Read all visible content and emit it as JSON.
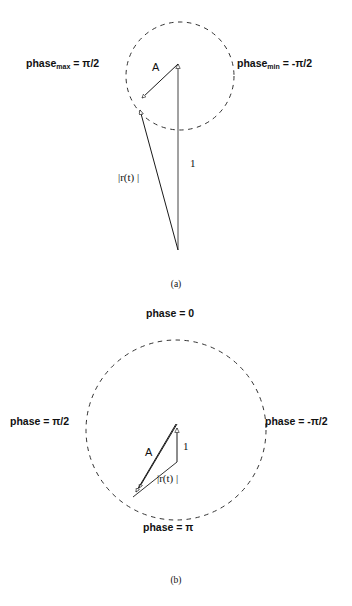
{
  "figure": {
    "background_color": "#ffffff",
    "line_color": "#1a1a1a",
    "panels": [
      {
        "id": "panel-a",
        "caption": "(a)",
        "circle": {
          "cx": 180,
          "cy": 76,
          "r": 54,
          "dashed": true
        },
        "labels": {
          "phase_max": {
            "text_main": "phase",
            "text_sub": "max",
            "text_tail": " = π/2",
            "x": 26,
            "y": 63
          },
          "phase_min": {
            "text_main": "phase",
            "text_sub": "min",
            "text_tail": " = -π/2",
            "x": 237,
            "y": 63
          }
        },
        "vectors": [
          {
            "name": "unity-vector",
            "label": "1",
            "label_x": 190,
            "label_y": 163,
            "x1": 178,
            "y1": 250,
            "x2": 178,
            "y2": 61
          },
          {
            "name": "resultant-vector",
            "label": "|r(t) |",
            "label_x": 118,
            "label_y": 177,
            "x1": 178,
            "y1": 250,
            "x2": 139,
            "y2": 107
          },
          {
            "name": "modulation-vector",
            "label": "A",
            "label_x": 152,
            "label_y": 67,
            "x1": 178,
            "y1": 64,
            "x2": 141,
            "y2": 97
          }
        ]
      },
      {
        "id": "panel-b",
        "caption": "(b)",
        "circle": {
          "cx": 176,
          "cy": 430,
          "r": 90,
          "dashed": true
        },
        "labels": {
          "phase_top": {
            "text": "phase = 0",
            "x": 146,
            "y": 313
          },
          "phase_left": {
            "text": "phase = π/2",
            "x": 10,
            "y": 421
          },
          "phase_right": {
            "text": "phase = -π/2",
            "x": 265,
            "y": 421
          },
          "phase_bottom": {
            "text": "phase = π",
            "x": 143,
            "y": 527
          }
        },
        "vectors": [
          {
            "name": "unity-vector",
            "label": "1",
            "label_x": 183,
            "label_y": 446,
            "x1": 177,
            "y1": 459,
            "x2": 177,
            "y2": 424
          },
          {
            "name": "resultant-vector",
            "label": "|r(t) |",
            "label_x": 157,
            "label_y": 478,
            "x1": 177,
            "y1": 424,
            "x2": 135,
            "y2": 494
          },
          {
            "name": "modulation-vector",
            "label": "A",
            "label_x": 145,
            "label_y": 452,
            "x1": 177,
            "y1": 424,
            "x2": 133,
            "y2": 497
          }
        ]
      }
    ]
  }
}
